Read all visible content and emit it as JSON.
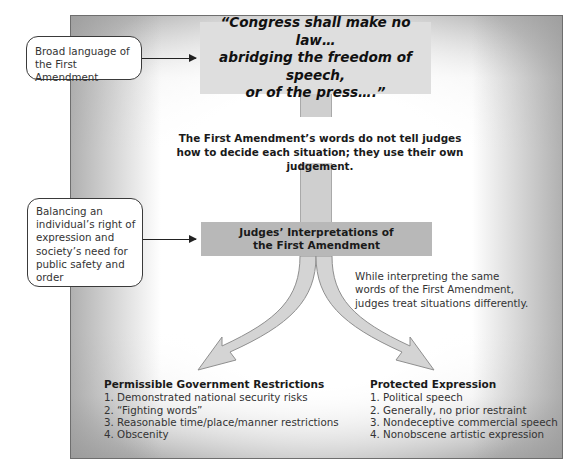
{
  "diagram": {
    "quote": {
      "lines": [
        "“Congress shall make no law…",
        "abridging the freedom of speech,",
        "or of the press….”"
      ]
    },
    "callouts": [
      {
        "lines": [
          "Broad language of",
          "the First Amendment"
        ]
      },
      {
        "lines": [
          "Balancing an",
          "individual’s right of",
          "expression and",
          "society’s need for",
          "public safety and",
          "order"
        ]
      }
    ],
    "mid_note": {
      "lines": [
        "The First Amendment’s words do not tell judges",
        "how to decide each situation; they use their own judgement."
      ]
    },
    "judges_box": {
      "lines": [
        "Judges’ Interpretations of",
        "the First Amendment"
      ]
    },
    "split_note": {
      "lines": [
        "While interpreting the same",
        "words of the First Amendment,",
        "judges treat situations differently."
      ]
    },
    "outcomes": {
      "left": {
        "title": "Permissible Government Restrictions",
        "items": [
          "1. Demonstrated national security risks",
          "2. “Fighting words”",
          "3. Reasonable time/place/manner restrictions",
          "4. Obscenity"
        ]
      },
      "right": {
        "title": "Protected Expression",
        "items": [
          "1. Political speech",
          "2. Generally, no prior restraint",
          "3. Nondeceptive commercial speech",
          "4. Nonobscene artistic expression"
        ]
      }
    },
    "colors": {
      "quote_box": "#dedede",
      "judges_box": "#b8b8b8",
      "arrow_fill": "#d4d4d4",
      "arrow_stroke": "#8f8f8f",
      "panel_border": "#6e6e6e"
    }
  }
}
